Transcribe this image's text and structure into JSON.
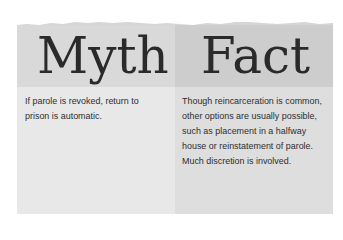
{
  "colors": {
    "myth_header": "#d9d9d9",
    "myth_body": "#e8e8e8",
    "fact_header": "#cdcdcd",
    "fact_body": "#dedede",
    "text": "#2e2e2e"
  },
  "myth": {
    "title": "Myth",
    "text": "If parole is revoked, return to prison is automatic."
  },
  "fact": {
    "title": "Fact",
    "text": "Though reincarceration is common, other options are usually possible, such as placement in a halfway house or reinstatement of parole. Much discretion is involved."
  }
}
